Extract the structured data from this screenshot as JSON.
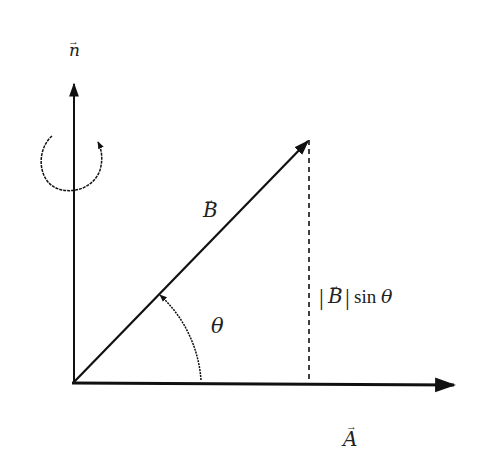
{
  "diagram": {
    "vectors": {
      "normal": {
        "label": "n",
        "arrow": "→"
      },
      "B": {
        "label": "B",
        "arrow": "→"
      },
      "A": {
        "label": "A",
        "arrow": "→"
      }
    },
    "angle": {
      "label": "θ"
    },
    "projection": {
      "bar_left": "|",
      "vec": "B",
      "bar_right": "|",
      "func": "sin",
      "angle": "θ"
    },
    "colors": {
      "stroke": "#111111",
      "background": "#ffffff"
    }
  }
}
